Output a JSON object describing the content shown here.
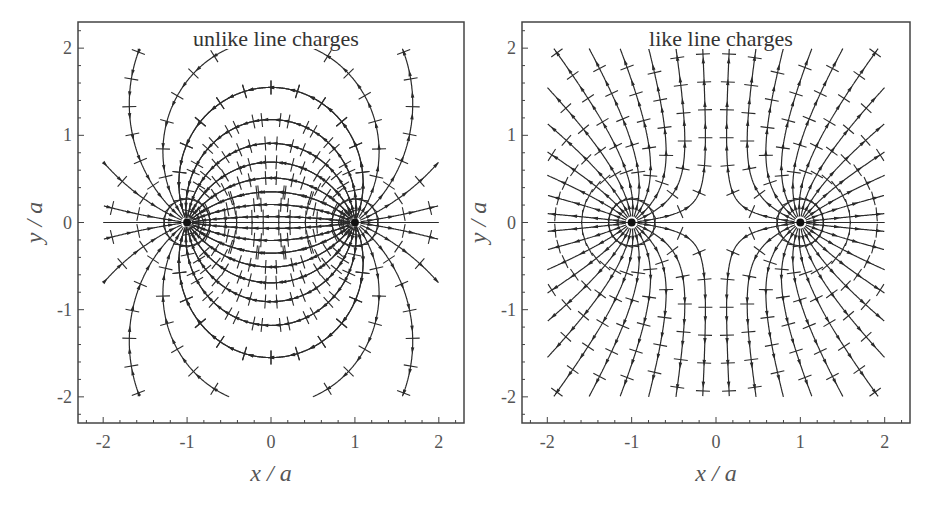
{
  "chart_data": [
    {
      "type": "vector-field",
      "title": "unlike line charges",
      "xlabel": "x/a",
      "ylabel": "y/a",
      "xlim": [
        -2.3,
        2.3
      ],
      "ylim": [
        -2.3,
        2.3
      ],
      "xticks": [
        "-2",
        "-1",
        "0",
        "1",
        "2"
      ],
      "yticks": [
        "2",
        "1",
        "0",
        "-1",
        "-2"
      ],
      "charges": [
        {
          "x": -1,
          "y": 0,
          "sign": "-"
        },
        {
          "x": 1,
          "y": 0,
          "sign": "+"
        }
      ],
      "grid": false,
      "description": "Electric field lines (with arrows) and equipotential tick marks for two line charges of opposite sign"
    },
    {
      "type": "vector-field",
      "title": "like line charges",
      "xlabel": "x/a",
      "ylabel": "y/a",
      "xlim": [
        -2.3,
        2.3
      ],
      "ylim": [
        -2.3,
        2.3
      ],
      "xticks": [
        "-2",
        "-1",
        "0",
        "1",
        "2"
      ],
      "yticks": [
        "2",
        "1",
        "0",
        "-1",
        "-2"
      ],
      "charges": [
        {
          "x": -1,
          "y": 0,
          "sign": "+"
        },
        {
          "x": 1,
          "y": 0,
          "sign": "+"
        }
      ],
      "grid": false,
      "description": "Electric field lines (with arrows) and equipotential tick marks for two line charges of the same sign"
    }
  ],
  "panels": {
    "left": {
      "title": "unlike line charges",
      "xlabel": "x / a",
      "ylabel": "y / a",
      "xticks": [
        "-2",
        "-1",
        "0",
        "1",
        "2"
      ],
      "yticks": [
        "2",
        "1",
        "0",
        "-1",
        "-2"
      ]
    },
    "right": {
      "title": "like line charges",
      "xlabel": "x / a",
      "ylabel": "y / a",
      "xticks": [
        "-2",
        "-1",
        "0",
        "1",
        "2"
      ],
      "yticks": [
        "2",
        "1",
        "0",
        "-1",
        "-2"
      ]
    }
  },
  "colors": {
    "line": "#2a2a2a",
    "axis": "#444444",
    "text": "#555555"
  }
}
